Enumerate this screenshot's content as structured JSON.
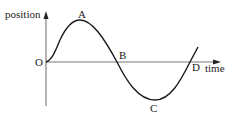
{
  "diagram": {
    "type": "position-time graph (sine wave)",
    "y_axis_label": "position",
    "x_axis_label": "time",
    "origin_label": "O",
    "points": [
      {
        "label": "A",
        "meaning": "maximum (crest)"
      },
      {
        "label": "B",
        "meaning": "zero crossing"
      },
      {
        "label": "C",
        "meaning": "minimum (trough)"
      },
      {
        "label": "D",
        "meaning": "zero crossing"
      }
    ],
    "colors": {
      "curve": "#1a1a1a",
      "axis": "#666666",
      "text": "#222222"
    }
  }
}
